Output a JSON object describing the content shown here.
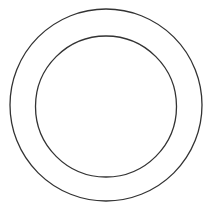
{
  "diagram": {
    "type": "concentric-circles",
    "background": "#ffffff",
    "stroke_color": "#333333",
    "stroke_width": 1.3,
    "circles": [
      {
        "name": "outer-circle",
        "cx": 106,
        "cy": 105,
        "r": 96
      },
      {
        "name": "inner-circle",
        "cx": 106,
        "cy": 106.5,
        "r": 70.5
      }
    ]
  }
}
